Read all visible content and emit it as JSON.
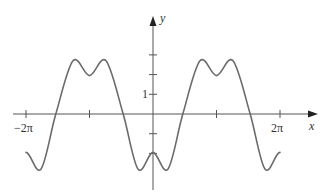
{
  "chart_data": {
    "type": "line",
    "title": "",
    "xlabel": "x",
    "ylabel": "y",
    "x_tick_labels": [
      {
        "pos_pi": -2,
        "label": "−2π"
      },
      {
        "pos_pi": -1,
        "label": ""
      },
      {
        "pos_pi": 1,
        "label": ""
      },
      {
        "pos_pi": 2,
        "label": "2π"
      }
    ],
    "y_tick_labels": [
      {
        "value": 3,
        "label": ""
      },
      {
        "value": 2,
        "label": ""
      },
      {
        "value": 1,
        "label": "1"
      },
      {
        "value": -1,
        "label": ""
      },
      {
        "value": -2,
        "label": ""
      }
    ],
    "xlim_pi": [
      -2,
      2
    ],
    "ylim": [
      -2.8,
      2.75
    ],
    "grid": false,
    "legend": null,
    "periodic": true,
    "period_pi": 2,
    "series": [
      {
        "name": "f(x)",
        "color": "#6b6b6b",
        "x_pi": [
          -2,
          -1.765,
          -1.53,
          -1.26,
          -1,
          -0.74,
          -0.47,
          -0.235,
          0,
          0.235,
          0.47,
          0.74,
          1,
          1.26,
          1.53,
          1.765,
          2
        ],
        "y": [
          -1.95,
          -2.8,
          0,
          2.7,
          1.95,
          2.7,
          0,
          -2.8,
          -1.95,
          -2.8,
          0,
          2.7,
          1.95,
          2.7,
          0,
          -2.8,
          -1.95
        ]
      }
    ]
  },
  "labels": {
    "x_axis": "x",
    "y_axis": "y",
    "neg_two_pi": "−2π",
    "two_pi": "2π",
    "one": "1"
  }
}
